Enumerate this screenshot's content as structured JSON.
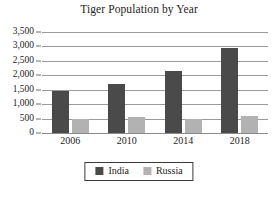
{
  "chart_data": {
    "type": "bar",
    "title": "Tiger Population by Year",
    "xlabel": "",
    "ylabel": "",
    "categories": [
      "2006",
      "2010",
      "2014",
      "2018"
    ],
    "series": [
      {
        "name": "India",
        "color": "#4a4a4a",
        "values": [
          1450,
          1700,
          2150,
          2950
        ]
      },
      {
        "name": "Russia",
        "color": "#b2b2b2",
        "values": [
          500,
          540,
          500,
          580
        ]
      }
    ],
    "ylim": [
      0,
      3500
    ],
    "ytick_values": [
      0,
      500,
      1000,
      1500,
      2000,
      2500,
      3000,
      3500
    ],
    "ytick_labels": [
      "0",
      "500",
      "1,000",
      "1,500",
      "2,000",
      "2,500",
      "3,000",
      "3,500"
    ],
    "grid": true,
    "grid_axis": "y",
    "legend_position": "bottom",
    "legend_entries": [
      "India",
      "Russia"
    ]
  }
}
